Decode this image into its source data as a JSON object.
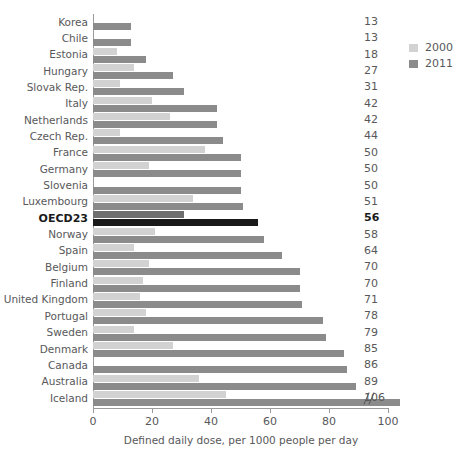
{
  "chart_data": {
    "type": "bar",
    "orientation": "horizontal",
    "title": "",
    "xlabel": "Defined daily dose, per 1000 people per day",
    "ylabel": "",
    "xlim": [
      0,
      100
    ],
    "xticks": [
      0,
      20,
      40,
      60,
      80,
      100
    ],
    "xtick_labels": [
      "0",
      "20",
      "40",
      "60",
      "80",
      "100"
    ],
    "grid": false,
    "legend_position": "top-right",
    "axis_break_note": "Iceland 2011 bar exceeds axis maximum; break marker shown near 100",
    "categories": [
      "Korea",
      "Chile",
      "Estonia",
      "Hungary",
      "Slovak Rep.",
      "Italy",
      "Netherlands",
      "Czech Rep.",
      "France",
      "Germany",
      "Slovenia",
      "Luxembourg",
      "OECD23",
      "Norway",
      "Spain",
      "Belgium",
      "Finland",
      "United Kingdom",
      "Portugal",
      "Sweden",
      "Denmark",
      "Canada",
      "Australia",
      "Iceland"
    ],
    "highlight_category": "OECD23",
    "series": [
      {
        "name": "2000",
        "color": "#d2d2d2",
        "values": [
          0,
          0,
          8,
          14,
          9,
          20,
          26,
          9,
          38,
          19,
          0,
          34,
          31,
          21,
          14,
          19,
          17,
          16,
          18,
          14,
          27,
          0,
          36,
          45
        ]
      },
      {
        "name": "2011",
        "color": "#8b8b8b",
        "values": [
          13,
          13,
          18,
          27,
          31,
          42,
          42,
          44,
          50,
          50,
          50,
          51,
          56,
          58,
          64,
          70,
          70,
          71,
          78,
          79,
          85,
          86,
          89,
          106
        ]
      }
    ],
    "value_labels": [
      "13",
      "13",
      "18",
      "27",
      "31",
      "42",
      "42",
      "44",
      "50",
      "50",
      "50",
      "51",
      "56",
      "58",
      "64",
      "70",
      "70",
      "71",
      "78",
      "79",
      "85",
      "86",
      "89",
      "106"
    ],
    "highlight_color": "#1a1a1a",
    "highlight_color_2000": "#6e6e6e"
  },
  "legend": {
    "items": [
      {
        "label": "2000",
        "color": "#d2d2d2"
      },
      {
        "label": "2011",
        "color": "#8b8b8b"
      }
    ]
  }
}
